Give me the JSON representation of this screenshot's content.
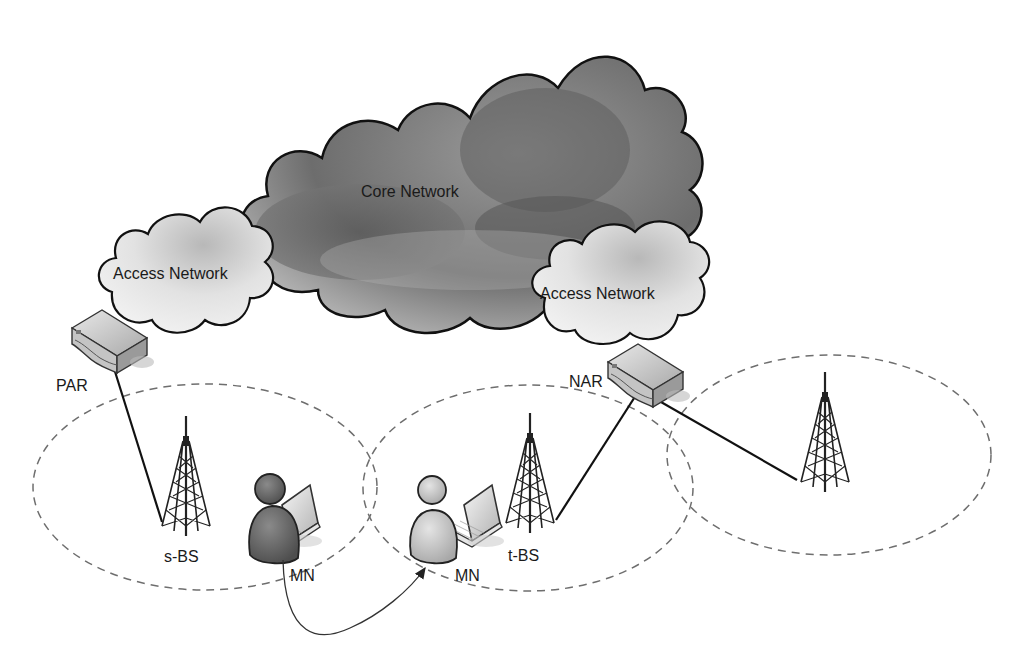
{
  "diagram": {
    "clouds": {
      "core": {
        "label": "Core Network",
        "color": "#6e6e6e"
      },
      "access_left": {
        "label": "Access Network",
        "color": "#d8d8d8"
      },
      "access_right": {
        "label": "Access Network",
        "color": "#d8d8d8"
      }
    },
    "routers": {
      "par": {
        "label": "PAR"
      },
      "nar": {
        "label": "NAR"
      }
    },
    "base_stations": {
      "source": {
        "label": "s-BS"
      },
      "target": {
        "label": "t-BS"
      },
      "third": {
        "label": ""
      }
    },
    "mobile_nodes": {
      "old": {
        "label": "MN",
        "color": "#6a6a6a"
      },
      "new": {
        "label": "MN",
        "color": "#c4c4c4"
      }
    },
    "coverage_style": {
      "stroke": "#707070",
      "dash": "8 6"
    },
    "movement_arrow": {
      "from": "MN (s-BS cell)",
      "to": "MN (t-BS cell)"
    }
  }
}
